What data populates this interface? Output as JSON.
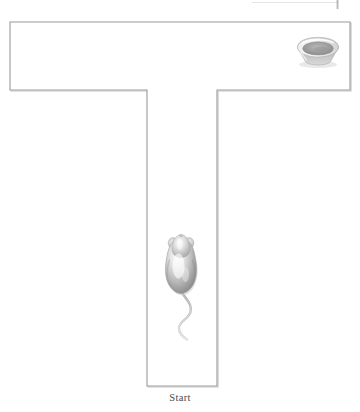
{
  "figure": {
    "background_color": "#ffffff",
    "line_color": "#9a9a9a",
    "line_shadow_color": "#c9c9c9",
    "fill_color": "#ffffff"
  },
  "labels": {
    "start": "Start"
  },
  "maze": {
    "shape": "T",
    "arm_left_x": 10,
    "arm_top_y": 22,
    "arm_right_x": 350,
    "arm_bottom_y": 90,
    "stem_left_x": 147,
    "stem_right_x": 217,
    "stem_bottom_y": 386,
    "stroke_width": 1.1
  },
  "objects": {
    "food_bowl": {
      "name": "food-bowl",
      "center_x": 318,
      "center_y": 52,
      "width": 42,
      "height": 27,
      "rim_color": "#d8d8d8",
      "interior_color": "#9e9e9e",
      "body_color": "#cfcfcf"
    },
    "mouse": {
      "name": "mouse",
      "center_x": 181,
      "center_y": 268,
      "body_length": 52,
      "body_width": 30,
      "facing": "up",
      "body_color": "#c6c6c6",
      "highlight_color": "#f2f2f2",
      "shadow_color": "#8c8c8c",
      "tail_color": "#b5b5b5"
    }
  },
  "artifacts": {
    "scan_mark_top_right": true
  }
}
